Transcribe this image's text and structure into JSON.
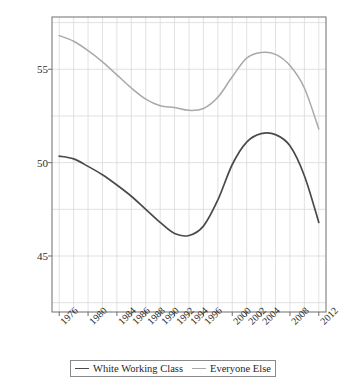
{
  "chart_data": {
    "type": "line",
    "title": "",
    "subtitle": "",
    "xlabel": "",
    "ylabel": "Feeling Thermometer Score",
    "xlim": [
      1975,
      2013
    ],
    "ylim": [
      42.0,
      57.8
    ],
    "yticks": [
      45,
      50,
      55
    ],
    "ytick_labels": [
      "45",
      "50",
      "55"
    ],
    "xtick_labels": [
      "1976",
      "1980",
      "1984",
      "1986",
      "1988",
      "1990",
      "1992",
      "1994",
      "1996",
      "2000",
      "2002",
      "2004",
      "2008",
      "2012"
    ],
    "xticks": [
      1976,
      1980,
      1984,
      1986,
      1988,
      1990,
      1992,
      1994,
      1996,
      2000,
      2002,
      2004,
      2008,
      2012
    ],
    "grid": true,
    "grid_color": "#d9d9d9",
    "grid_x_step": 2,
    "frame": true,
    "frame_color": "#6f6f6f",
    "legend_position": "bottom",
    "series": [
      {
        "name": "White Working Class",
        "color": "#4a4a4a",
        "x": [
          1976,
          1978,
          1980,
          1982,
          1984,
          1986,
          1988,
          1990,
          1992,
          1994,
          1996,
          1998,
          2000,
          2002,
          2004,
          2006,
          2008,
          2010,
          2012
        ],
        "values": [
          50.35,
          50.2,
          49.8,
          49.35,
          48.8,
          48.2,
          47.5,
          46.8,
          46.2,
          46.1,
          46.6,
          48.0,
          49.9,
          51.1,
          51.55,
          51.5,
          50.9,
          49.3,
          46.8
        ]
      },
      {
        "name": "Everyone Else",
        "color": "#a9a9a9",
        "x": [
          1976,
          1978,
          1980,
          1982,
          1984,
          1986,
          1988,
          1990,
          1992,
          1994,
          1996,
          1998,
          2000,
          2002,
          2004,
          2006,
          2008,
          2010,
          2012
        ],
        "values": [
          56.8,
          56.5,
          56.0,
          55.4,
          54.7,
          54.0,
          53.4,
          53.05,
          52.95,
          52.8,
          52.9,
          53.5,
          54.6,
          55.6,
          55.9,
          55.8,
          55.2,
          54.0,
          51.8
        ]
      }
    ]
  },
  "legend": {
    "entries": [
      {
        "label": "White Working Class"
      },
      {
        "label": "Everyone Else"
      }
    ]
  }
}
